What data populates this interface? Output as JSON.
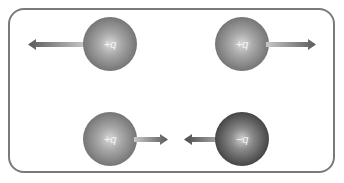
{
  "diagram": {
    "title": "",
    "charges": [
      {
        "id": "top-left",
        "label": "+q",
        "sign": "positive",
        "force_direction": "left"
      },
      {
        "id": "top-right",
        "label": "+q",
        "sign": "positive",
        "force_direction": "right"
      },
      {
        "id": "bottom-left",
        "label": "+q",
        "sign": "positive",
        "force_direction": "right"
      },
      {
        "id": "bottom-right",
        "label": "−q",
        "sign": "negative",
        "force_direction": "left"
      }
    ],
    "colors": {
      "border": "#7a7a7a",
      "positive_sphere": "#8a8a8a",
      "negative_sphere": "#3e3e3e",
      "arrow": "#6e6e6e"
    }
  }
}
